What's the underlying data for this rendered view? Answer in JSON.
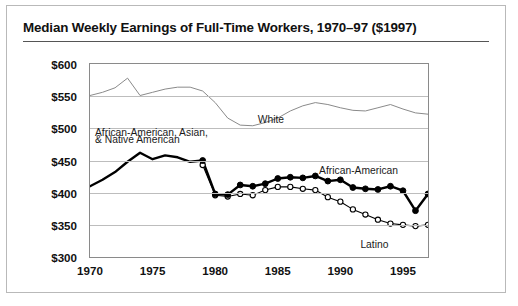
{
  "card": {
    "title": "Median Weekly Earnings of Full-Time Workers, 1970–97 ($1997)"
  },
  "labels": {
    "white": "White",
    "combined": "African-American, Asian,\n& Native American",
    "combined_line1": "African-American, Asian,",
    "combined_line2": "& Native American",
    "african_american": "African-American",
    "latino": "Latino"
  },
  "colors": {
    "white_line": "#8a8a8a",
    "african_american_line": "#000000",
    "latino_line": "#000000",
    "latino_marker_fill": "#ffffff",
    "grid": "#bdbdbd",
    "frame": "#8a8a8a",
    "card_border": "#b9b9b9",
    "text": "#111111"
  },
  "chart_data": {
    "type": "line",
    "title": "Median Weekly Earnings of Full-Time Workers, 1970–97 ($1997)",
    "xlabel": "",
    "ylabel": "",
    "xlim": [
      1970,
      1997
    ],
    "ylim": [
      300,
      600
    ],
    "yticks": [
      300,
      350,
      400,
      450,
      500,
      550,
      600
    ],
    "ytick_labels": [
      "$300",
      "$350",
      "$400",
      "$450",
      "$500",
      "$550",
      "$600"
    ],
    "xticks": [
      1970,
      1975,
      1980,
      1985,
      1990,
      1995
    ],
    "xtick_labels": [
      "1970",
      "1975",
      "1980",
      "1985",
      "1990",
      "1995"
    ],
    "grid": "horizontal",
    "legend": "inline-annotations",
    "series": [
      {
        "name": "White",
        "style": "thin-line",
        "markers": false,
        "x": [
          1970,
          1971,
          1972,
          1973,
          1974,
          1975,
          1976,
          1977,
          1978,
          1979,
          1980,
          1981,
          1982,
          1983,
          1984,
          1985,
          1986,
          1987,
          1988,
          1989,
          1990,
          1991,
          1992,
          1993,
          1994,
          1995,
          1996,
          1997
        ],
        "values": [
          551,
          556,
          563,
          578,
          551,
          556,
          561,
          564,
          564,
          558,
          540,
          516,
          505,
          504,
          509,
          516,
          527,
          535,
          540,
          537,
          532,
          528,
          527,
          532,
          537,
          530,
          524,
          522
        ]
      },
      {
        "name": "African-American, Asian, & Native American",
        "style": "thick-line",
        "markers": false,
        "note": "combined series 1970–1979, splits at 1979",
        "x": [
          1970,
          1971,
          1972,
          1973,
          1974,
          1975,
          1976,
          1977,
          1978,
          1979
        ],
        "values": [
          410,
          420,
          432,
          448,
          462,
          452,
          458,
          455,
          448,
          450
        ]
      },
      {
        "name": "African-American",
        "style": "thick-line-filled-markers",
        "markers": true,
        "marker": "filled-circle",
        "x": [
          1979,
          1980,
          1981,
          1982,
          1983,
          1984,
          1985,
          1986,
          1987,
          1988,
          1989,
          1990,
          1991,
          1992,
          1993,
          1994,
          1995,
          1996,
          1997
        ],
        "values": [
          450,
          398,
          397,
          412,
          410,
          414,
          422,
          424,
          423,
          426,
          418,
          420,
          408,
          406,
          405,
          410,
          403,
          372,
          398
        ]
      },
      {
        "name": "Latino",
        "style": "thin-line-open-markers",
        "markers": true,
        "marker": "open-circle",
        "x": [
          1979,
          1980,
          1981,
          1982,
          1983,
          1984,
          1985,
          1986,
          1987,
          1988,
          1989,
          1990,
          1991,
          1992,
          1993,
          1994,
          1995,
          1996,
          1997
        ],
        "values": [
          443,
          396,
          394,
          398,
          396,
          404,
          409,
          409,
          406,
          404,
          393,
          386,
          374,
          366,
          358,
          352,
          350,
          348,
          350
        ]
      }
    ],
    "annotations": [
      {
        "text": "White",
        "x": 1983.4,
        "y": 523
      },
      {
        "text": "African-American, Asian,",
        "x": 1970.4,
        "y": 502
      },
      {
        "text": "& Native American",
        "x": 1970.4,
        "y": 491
      },
      {
        "text": "African-American",
        "x": 1988.3,
        "y": 443
      },
      {
        "text": "Latino",
        "x": 1991.6,
        "y": 328
      }
    ]
  }
}
